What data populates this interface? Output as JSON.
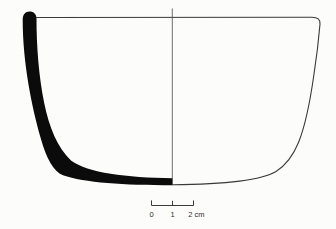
{
  "figure": {
    "kind": "archaeological pottery vessel profile drawing",
    "colors": {
      "ink": "#3a3a3a",
      "centerline_ink": "#4a4a4a",
      "section_fill": "#0b0b0b",
      "background": "#fcfcfb"
    },
    "scale_bar": {
      "unit": "cm",
      "labels": {
        "start": "0",
        "middle": "1",
        "end": "2 cm"
      }
    }
  }
}
